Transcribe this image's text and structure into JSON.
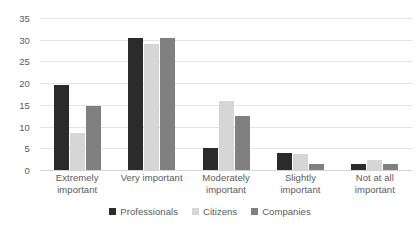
{
  "chart_data": {
    "type": "bar",
    "title": "",
    "subtitle": "",
    "xlabel": "",
    "ylabel": "",
    "ylim": [
      0,
      35
    ],
    "ytick_step": 5,
    "yticks": [
      0,
      5,
      10,
      15,
      20,
      25,
      30,
      35
    ],
    "grid": true,
    "grid_axis": "y",
    "legend_position": "bottom",
    "orientation": "vertical",
    "grouping": "grouped",
    "categories": [
      "Extremely important",
      "Very important",
      "Moderately important",
      "Slightly important",
      "Not at all important"
    ],
    "category_lines": [
      [
        "Extremely",
        "important"
      ],
      [
        "Very important",
        ""
      ],
      [
        "Moderately",
        "important"
      ],
      [
        "Slightly",
        "important"
      ],
      [
        "Not at all",
        "important"
      ]
    ],
    "series": [
      {
        "name": "Professionals",
        "color": "#2b2b2b",
        "values": [
          19.5,
          30.5,
          5.0,
          4.0,
          1.5
        ]
      },
      {
        "name": "Citizens",
        "color": "#d6d6d6",
        "values": [
          8.5,
          29.0,
          16.0,
          3.8,
          2.2
        ]
      },
      {
        "name": "Companies",
        "color": "#808080",
        "values": [
          14.7,
          30.5,
          12.5,
          1.3,
          1.5
        ]
      }
    ]
  },
  "style": {
    "background": "#ffffff",
    "gridline_color": "#e4e4e4",
    "axis_color": "#d4d4d4",
    "tick_label_color": "#5a5a5a"
  }
}
